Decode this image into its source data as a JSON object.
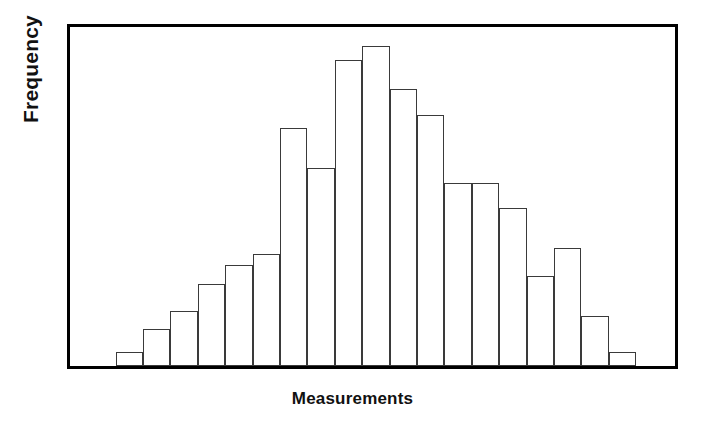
{
  "chart_data": {
    "type": "bar",
    "title": "",
    "xlabel": "Measurements",
    "ylabel": "Frequency",
    "grid": false,
    "legend": null,
    "axis_tick_labels": {
      "x": [],
      "y": []
    },
    "ylim": [
      0,
      300
    ],
    "bin_count": 19,
    "categories": [
      "1",
      "2",
      "3",
      "4",
      "5",
      "6",
      "7",
      "8",
      "9",
      "10",
      "11",
      "12",
      "13",
      "14",
      "15",
      "16",
      "17",
      "18",
      "19"
    ],
    "values": [
      12,
      33,
      49,
      73,
      89,
      99,
      211,
      175,
      271,
      283,
      245,
      222,
      162,
      162,
      140,
      80,
      104,
      44,
      12
    ],
    "series": [
      {
        "name": "Frequency",
        "values": [
          12,
          33,
          49,
          73,
          89,
          99,
          211,
          175,
          271,
          283,
          245,
          222,
          162,
          162,
          140,
          80,
          104,
          44,
          12
        ]
      }
    ]
  },
  "style": {
    "bar_fill": "#ffffff",
    "bar_stroke": "#3a3a3a",
    "frame_stroke": "#000000",
    "background": "#ffffff",
    "text_color": "#111111"
  },
  "geometry": {
    "bar_start_fraction": 0.0753,
    "bar_width_fraction": 0.0453
  }
}
